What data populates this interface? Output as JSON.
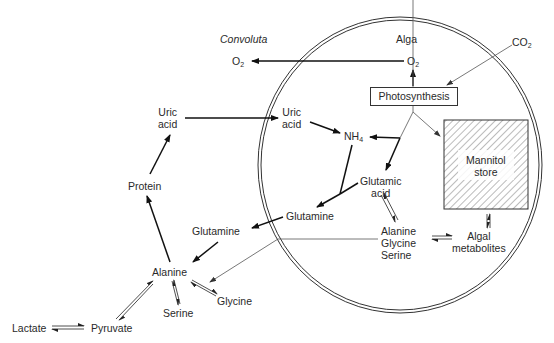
{
  "diagram": {
    "title_animal": "Convoluta",
    "title_alga": "Alga",
    "nodes": {
      "o2_outside": "O",
      "o2_outside_sub": "2",
      "o2_inside": "O",
      "o2_inside_sub": "2",
      "co2": "CO",
      "co2_sub": "2",
      "photosynthesis": "Photosynthesis",
      "uric_acid_outside_1": "Uric",
      "uric_acid_outside_2": "acid",
      "uric_acid_inside_1": "Uric",
      "uric_acid_inside_2": "acid",
      "nh4": "NH",
      "nh4_sub": "4",
      "mannitol_1": "Mannitol",
      "mannitol_2": "store",
      "protein": "Protein",
      "glutamic_1": "Glutamic",
      "glutamic_2": "acid",
      "glutamine_inside": "Glutamine",
      "glutamine_outside": "Glutamine",
      "aa_1": "Alanine",
      "aa_2": "Glycine",
      "aa_3": "Serine",
      "algal_met_1": "Algal",
      "algal_met_2": "metabolites",
      "alanine": "Alanine",
      "serine": "Serine",
      "glycine": "Glycine",
      "lactate": "Lactate",
      "pyruvate": "Pyruvate"
    },
    "colors": {
      "line": "#111111",
      "thin_line": "#555555",
      "hatch": "#555555"
    }
  }
}
